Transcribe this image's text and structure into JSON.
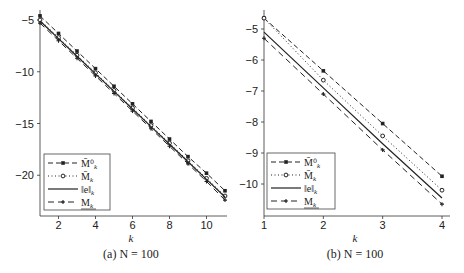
{
  "chart_data": [
    {
      "type": "line",
      "title": "(a) N = 100",
      "xlabel": "k",
      "ylabel": "",
      "xlim": [
        1,
        11
      ],
      "ylim": [
        -23.5,
        -4.5
      ],
      "x_ticks": [
        2,
        4,
        6,
        8,
        10
      ],
      "y_ticks": [
        -5,
        -10,
        -15,
        -20
      ],
      "grid": false,
      "legend_position": "lower left",
      "x": [
        1,
        2,
        3,
        4,
        5,
        6,
        7,
        8,
        9,
        10,
        11
      ],
      "series": [
        {
          "name": "M̄⁰_k",
          "style": "dashed, square markers",
          "values": [
            -4.6,
            -6.3,
            -8.0,
            -9.7,
            -11.4,
            -13.1,
            -14.8,
            -16.5,
            -18.2,
            -19.8,
            -21.5
          ]
        },
        {
          "name": "M̄_k",
          "style": "dotted, diamond markers",
          "values": [
            -5.0,
            -6.7,
            -8.4,
            -10.1,
            -11.8,
            -13.5,
            -15.2,
            -16.9,
            -18.6,
            -20.3,
            -22.0
          ]
        },
        {
          "name": "‖e_k‖",
          "style": "solid",
          "values": [
            -5.1,
            -6.8,
            -8.5,
            -10.2,
            -11.9,
            -13.6,
            -15.3,
            -17.0,
            -18.7,
            -20.4,
            -22.1
          ]
        },
        {
          "name": "M_k",
          "style": "dashed, plus markers",
          "values": [
            -5.3,
            -7.0,
            -8.7,
            -10.4,
            -12.1,
            -13.8,
            -15.5,
            -17.2,
            -18.9,
            -20.6,
            -22.4
          ]
        }
      ]
    },
    {
      "type": "line",
      "title": "(b) N = 100",
      "xlabel": "k",
      "ylabel": "",
      "xlim": [
        1,
        4.1
      ],
      "ylim": [
        -10.9,
        -4.4
      ],
      "x_ticks": [
        1,
        2,
        3,
        4
      ],
      "y_ticks": [
        -5,
        -6,
        -7,
        -8,
        -9,
        -10
      ],
      "grid": false,
      "legend_position": "lower left",
      "x": [
        1,
        2,
        3,
        4
      ],
      "series": [
        {
          "name": "M̄⁰_k",
          "style": "dashed, square markers",
          "values": [
            -4.65,
            -6.35,
            -8.05,
            -9.75
          ]
        },
        {
          "name": "M̄_k",
          "style": "dotted, diamond markers",
          "values": [
            -4.65,
            -6.65,
            -8.45,
            -10.2
          ]
        },
        {
          "name": "‖e_k‖",
          "style": "solid",
          "values": [
            -5.1,
            -6.9,
            -8.7,
            -10.45
          ]
        },
        {
          "name": "M_k",
          "style": "dashed, plus markers",
          "values": [
            -5.3,
            -7.1,
            -8.9,
            -10.65
          ]
        }
      ]
    }
  ],
  "panels": [
    {
      "caption": "(a) N = 100",
      "xlabel": "k",
      "x_tick_labels": [
        "2",
        "4",
        "6",
        "8",
        "10"
      ],
      "y_tick_labels": [
        "−5",
        "−10",
        "−15",
        "−20"
      ],
      "legend": [
        "M̄⁰",
        "M̄",
        "‖e‖",
        "M"
      ]
    },
    {
      "caption": "(b) N = 100",
      "xlabel": "k",
      "x_tick_labels": [
        "1",
        "2",
        "3",
        "4"
      ],
      "y_tick_labels": [
        "−5",
        "−6",
        "−7",
        "−8",
        "−9",
        "−10"
      ],
      "legend": [
        "M̄⁰",
        "M̄",
        "‖e‖",
        "M"
      ]
    }
  ],
  "legend_subscript": "k",
  "colors": {
    "ink": "#222222",
    "background": "#ffffff"
  }
}
